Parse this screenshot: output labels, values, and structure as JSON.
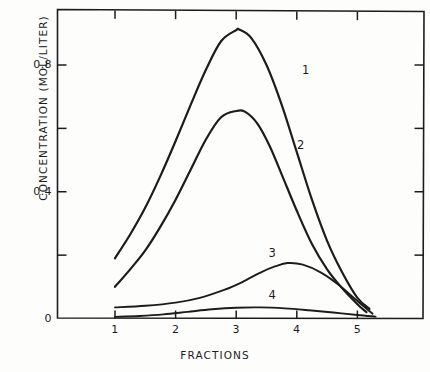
{
  "figure": {
    "background_color": "#fdfdfc",
    "ink_color": "#1c1c1c"
  },
  "axes": {
    "x_axis_title": "FRACTIONS",
    "y_axis_title": "CONCENTRATION (MOL/LITER)",
    "x_tick_labels": [
      "1",
      "2",
      "3",
      "4",
      "5"
    ],
    "y_tick_labels": [
      "0",
      "0.4",
      "0.8"
    ]
  },
  "curve_labels": {
    "curve1": "1",
    "curve2": "2",
    "curve3": "3",
    "curve4": "4"
  },
  "chart_data": {
    "type": "line",
    "title": "",
    "subtitle": "",
    "xlabel": "FRACTIONS",
    "ylabel": "CONCENTRATION (MOL/LITER)",
    "xlim": [
      0.75,
      5.35
    ],
    "ylim": [
      -0.02,
      1.0
    ],
    "x_ticks": [
      1,
      2,
      3,
      4,
      5
    ],
    "x_tick_labels": [
      "1",
      "2",
      "3",
      "4",
      "5"
    ],
    "y_ticks": [
      0,
      0.2,
      0.4,
      0.6,
      0.8
    ],
    "y_tick_labels": [
      "0",
      "",
      "0.4",
      "",
      "0.8"
    ],
    "y_labeled_ticks": [
      0,
      0.4,
      0.8
    ],
    "grid": false,
    "legend": "inline-curve-labels",
    "legend_position": "on-curve",
    "frame": "box-with-inward-ticks",
    "series": [
      {
        "name": "1",
        "label": "1",
        "label_x": 4.15,
        "label_y": 0.78,
        "peak_x": 3.05,
        "peak_y": 0.91,
        "x": [
          1.0,
          1.25,
          1.5,
          1.75,
          2.0,
          2.25,
          2.5,
          2.75,
          3.0,
          3.05,
          3.25,
          3.5,
          3.75,
          4.0,
          4.25,
          4.5,
          4.75,
          5.0,
          5.2
        ],
        "values": [
          0.19,
          0.265,
          0.35,
          0.45,
          0.56,
          0.675,
          0.785,
          0.875,
          0.91,
          0.912,
          0.885,
          0.8,
          0.675,
          0.525,
          0.375,
          0.245,
          0.145,
          0.065,
          0.03
        ]
      },
      {
        "name": "2",
        "label": "2",
        "label_x": 4.07,
        "label_y": 0.545,
        "peak_x": 3.0,
        "peak_y": 0.655,
        "x": [
          1.0,
          1.25,
          1.5,
          1.75,
          2.0,
          2.25,
          2.5,
          2.75,
          3.0,
          3.15,
          3.35,
          3.55,
          3.75,
          4.0,
          4.25,
          4.5,
          4.75,
          5.0,
          5.15
        ],
        "values": [
          0.1,
          0.155,
          0.215,
          0.29,
          0.375,
          0.47,
          0.565,
          0.635,
          0.655,
          0.652,
          0.615,
          0.545,
          0.455,
          0.34,
          0.235,
          0.155,
          0.095,
          0.045,
          0.02
        ]
      },
      {
        "name": "3",
        "label": "3",
        "label_x": 3.6,
        "label_y": 0.205,
        "peak_x": 3.85,
        "peak_y": 0.175,
        "x": [
          1.0,
          1.5,
          2.0,
          2.4,
          2.8,
          3.1,
          3.4,
          3.65,
          3.85,
          4.1,
          4.4,
          4.7,
          5.0,
          5.25
        ],
        "values": [
          0.035,
          0.04,
          0.05,
          0.065,
          0.09,
          0.115,
          0.145,
          0.165,
          0.175,
          0.17,
          0.145,
          0.105,
          0.055,
          0.015
        ]
      },
      {
        "name": "4",
        "label": "4",
        "label_x": 3.6,
        "label_y": 0.072,
        "peak_x": 3.4,
        "peak_y": 0.035,
        "x": [
          1.0,
          1.4,
          1.8,
          2.2,
          2.6,
          3.0,
          3.4,
          3.8,
          4.2,
          4.6,
          5.0,
          5.3
        ],
        "values": [
          0.005,
          0.008,
          0.013,
          0.021,
          0.029,
          0.034,
          0.035,
          0.032,
          0.026,
          0.019,
          0.011,
          0.006
        ]
      }
    ]
  }
}
